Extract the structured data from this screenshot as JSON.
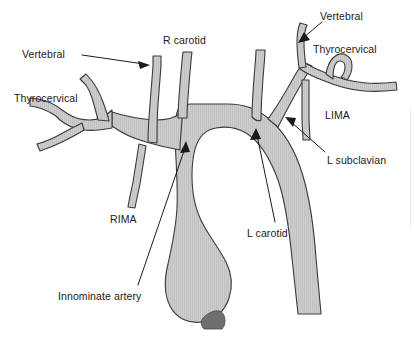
{
  "figure": {
    "background_color": "#ffffff",
    "vessel_fill_color": "#c9c9c9",
    "vessel_stroke_color": "#3a3a3a",
    "valve_color": "#6f6f6f",
    "label_color": "#1a1a1a"
  },
  "labels": [
    {
      "id": "vertebral-right",
      "text": "Vertebral",
      "x": 22,
      "y": 49,
      "has_leader": true,
      "leader_style": "line-with-arrowhead"
    },
    {
      "id": "r-carotid",
      "text": "R carotid",
      "x": 163,
      "y": 35,
      "has_leader": false,
      "leader_style": "none"
    },
    {
      "id": "thyrocervical-right",
      "text": "Thyrocervical",
      "x": 14,
      "y": 93,
      "has_leader": false,
      "leader_style": "none"
    },
    {
      "id": "rima",
      "text": "RIMA",
      "x": 110,
      "y": 214,
      "has_leader": false,
      "leader_style": "none"
    },
    {
      "id": "innominate-artery",
      "text": "Innominate artery",
      "x": 58,
      "y": 291,
      "has_leader": true,
      "leader_style": "line-with-arrowhead"
    },
    {
      "id": "l-carotid",
      "text": "L carotid",
      "x": 247,
      "y": 228,
      "has_leader": true,
      "leader_style": "line-with-arrowhead"
    },
    {
      "id": "vertebral-left",
      "text": "Vertebral",
      "x": 320,
      "y": 11,
      "has_leader": true,
      "leader_style": "line-with-arrowhead"
    },
    {
      "id": "thyrocervical-left",
      "text": "Thyrocervical",
      "x": 313,
      "y": 44,
      "has_leader": false,
      "leader_style": "none"
    },
    {
      "id": "lima",
      "text": "LIMA",
      "x": 325,
      "y": 110,
      "has_leader": false,
      "leader_style": "none"
    },
    {
      "id": "l-subclavian",
      "text": "L subclavian",
      "x": 327,
      "y": 155,
      "has_leader": true,
      "leader_style": "line-with-arrowhead"
    }
  ],
  "structures": [
    {
      "id": "aortic-arch",
      "name": "Aortic arch"
    },
    {
      "id": "ascending-aorta",
      "name": "Ascending aorta"
    },
    {
      "id": "descending-aorta",
      "name": "Descending aorta"
    },
    {
      "id": "innominate-trunk",
      "name": "Innominate (brachiocephalic) artery"
    },
    {
      "id": "right-subclavian",
      "name": "Right subclavian artery"
    },
    {
      "id": "right-vertebral",
      "name": "Right vertebral artery"
    },
    {
      "id": "right-carotid",
      "name": "Right carotid artery"
    },
    {
      "id": "right-thyrocervical",
      "name": "Right thyrocervical trunk"
    },
    {
      "id": "rima-vessel",
      "name": "Right internal mammary artery"
    },
    {
      "id": "left-carotid",
      "name": "Left carotid artery"
    },
    {
      "id": "left-subclavian",
      "name": "Left subclavian artery"
    },
    {
      "id": "left-vertebral",
      "name": "Left vertebral artery"
    },
    {
      "id": "left-thyrocervical",
      "name": "Left thyrocervical trunk"
    },
    {
      "id": "lima-vessel",
      "name": "Left internal mammary artery"
    },
    {
      "id": "aortic-valve",
      "name": "Aortic valve / root shading"
    }
  ]
}
